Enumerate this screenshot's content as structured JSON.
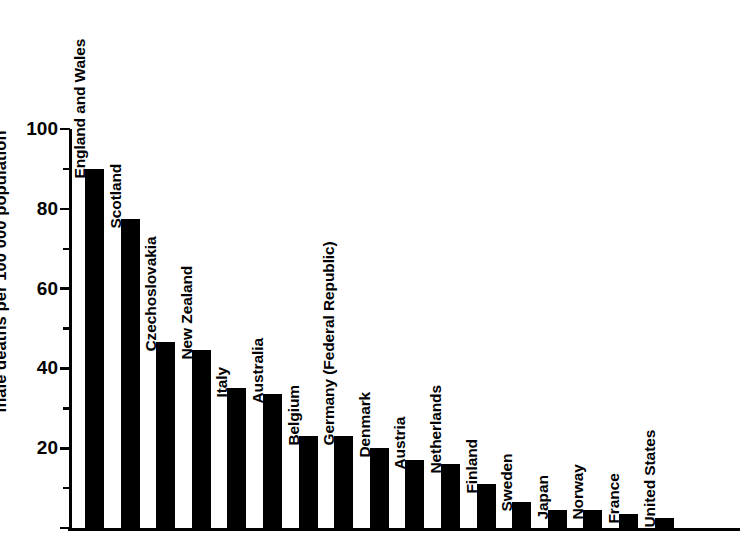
{
  "chart_data": {
    "type": "bar",
    "title": "",
    "xlabel": "",
    "ylabel": "male deaths per 100 000 population",
    "ylim": [
      0,
      100
    ],
    "grid": false,
    "legend": null,
    "y_ticks_major": [
      0,
      20,
      40,
      60,
      80,
      100
    ],
    "y_tick_labels": [
      "20",
      "40",
      "60",
      "80",
      "100"
    ],
    "y_ticks_minor": [
      10,
      30,
      50,
      70,
      90
    ],
    "categories": [
      "England and Wales",
      "Scotland",
      "Czechoslovakia",
      "New Zealand",
      "Italy",
      "Australia",
      "Belgium",
      "Germany (Federal Republic)",
      "Denmark",
      "Austria",
      "Netherlands",
      "Finland",
      "Sweden",
      "Japan",
      "Norway",
      "France",
      "United States"
    ],
    "values": [
      90,
      77.5,
      46.5,
      44.5,
      35,
      33.5,
      23,
      23,
      20,
      17,
      16,
      11,
      6.5,
      4.5,
      4.5,
      3.5,
      2.5
    ],
    "bar_color": "#000000",
    "background_color": "#ffffff"
  }
}
